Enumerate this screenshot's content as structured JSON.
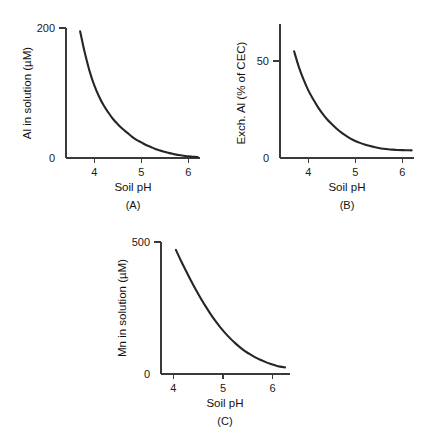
{
  "figure": {
    "background": "#ffffff",
    "curve_color": "#262626",
    "axis_color": "#3a3a3a",
    "text_color": "#111111"
  },
  "chart_data": [
    {
      "type": "line",
      "panel_label": "(A)",
      "title": "",
      "xlabel": "Soil pH",
      "ylabel": "Al in solution (µM)",
      "xlim": [
        3.4,
        6.25
      ],
      "ylim": [
        0,
        200
      ],
      "xticks": [
        4,
        5,
        6
      ],
      "xticklabels": [
        "4",
        "5",
        "6"
      ],
      "yticks": [
        0,
        200
      ],
      "yticklabels": [
        "0",
        "200"
      ],
      "grid": false,
      "legend": "none",
      "x": [
        3.7,
        3.75,
        3.8,
        3.9,
        4.0,
        4.1,
        4.2,
        4.3,
        4.4,
        4.5,
        4.6,
        4.7,
        4.8,
        4.9,
        5.0,
        5.1,
        5.2,
        5.3,
        5.4,
        5.5,
        5.6,
        5.7,
        5.8,
        5.9,
        6.0,
        6.1,
        6.2
      ],
      "y": [
        195,
        178,
        162,
        134,
        112,
        95,
        81,
        70,
        60,
        52,
        45,
        39,
        33,
        28,
        24,
        20,
        17,
        14,
        11.5,
        9.5,
        7.5,
        6,
        4.5,
        3.5,
        2.5,
        2,
        1.5
      ]
    },
    {
      "type": "line",
      "panel_label": "(B)",
      "title": "",
      "xlabel": "Soil pH",
      "ylabel": "Exch. Al (% of CEC)",
      "xlim": [
        3.4,
        6.25
      ],
      "ylim": [
        0,
        70
      ],
      "xticks": [
        4,
        5,
        6
      ],
      "xticklabels": [
        "4",
        "5",
        "6"
      ],
      "yticks": [
        0,
        50
      ],
      "yticklabels": [
        "0",
        "50"
      ],
      "grid": false,
      "legend": "none",
      "x": [
        3.7,
        3.8,
        3.9,
        4.0,
        4.1,
        4.2,
        4.3,
        4.4,
        4.5,
        4.6,
        4.7,
        4.8,
        4.9,
        5.0,
        5.1,
        5.2,
        5.3,
        5.4,
        5.5,
        5.6,
        5.7,
        5.8,
        5.9,
        6.0,
        6.1,
        6.2
      ],
      "y": [
        55,
        47,
        40.5,
        35,
        30.5,
        26.5,
        23,
        20,
        17.5,
        15.2,
        13.2,
        11.5,
        10,
        8.8,
        7.8,
        7.0,
        6.3,
        5.7,
        5.2,
        4.8,
        4.5,
        4.3,
        4.15,
        4.05,
        4.0,
        3.95
      ]
    },
    {
      "type": "line",
      "panel_label": "(C)",
      "title": "",
      "xlabel": "Soil pH",
      "ylabel": "Mn in solution (µM)",
      "xlim": [
        3.75,
        6.35
      ],
      "ylim": [
        0,
        500
      ],
      "xticks": [
        4,
        5,
        6
      ],
      "xticklabels": [
        "4",
        "5",
        "6"
      ],
      "yticks": [
        0,
        500
      ],
      "yticklabels": [
        "0",
        "500"
      ],
      "grid": false,
      "legend": "none",
      "x": [
        4.05,
        4.15,
        4.25,
        4.35,
        4.45,
        4.55,
        4.65,
        4.75,
        4.85,
        4.95,
        5.05,
        5.15,
        5.25,
        5.35,
        5.45,
        5.55,
        5.65,
        5.75,
        5.85,
        5.95,
        6.05,
        6.15,
        6.25
      ],
      "y": [
        470,
        430,
        392,
        355,
        320,
        287,
        256,
        227,
        200,
        176,
        154,
        134,
        116,
        100,
        86,
        74,
        63,
        54,
        46,
        39,
        33,
        28,
        25
      ]
    }
  ]
}
